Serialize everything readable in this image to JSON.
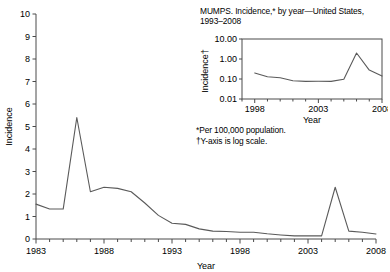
{
  "chart_data": [
    {
      "id": "main",
      "type": "line",
      "title": "",
      "xlabel": "Year",
      "ylabel": "Incidence",
      "xlim": [
        1983,
        2008
      ],
      "ylim": [
        0,
        10
      ],
      "yticks": [
        0,
        1,
        2,
        3,
        4,
        5,
        6,
        7,
        8,
        9,
        10
      ],
      "ytick_labels": [
        "0",
        "1",
        "2",
        "3",
        "4",
        "5",
        "6",
        "7",
        "8",
        "9",
        "10"
      ],
      "xticks": [
        1983,
        1984,
        1985,
        1986,
        1987,
        1988,
        1989,
        1990,
        1991,
        1992,
        1993,
        1994,
        1995,
        1996,
        1997,
        1998,
        1999,
        2000,
        2001,
        2002,
        2003,
        2004,
        2005,
        2006,
        2007,
        2008
      ],
      "xtick_labels": [
        "1983",
        "1988",
        "1993",
        "1998",
        "2003",
        "2008"
      ],
      "xtick_labeled_values": [
        1983,
        1988,
        1993,
        1998,
        2003,
        2008
      ],
      "grid": false,
      "legend": "none",
      "x": [
        1983,
        1984,
        1985,
        1986,
        1987,
        1988,
        1989,
        1990,
        1991,
        1992,
        1993,
        1994,
        1995,
        1996,
        1997,
        1998,
        1999,
        2000,
        2001,
        2002,
        2003,
        2004,
        2005,
        2006,
        2007,
        2008
      ],
      "values": [
        1.55,
        1.33,
        1.33,
        5.4,
        2.1,
        2.3,
        2.25,
        2.1,
        1.6,
        1.05,
        0.7,
        0.65,
        0.45,
        0.35,
        0.33,
        0.3,
        0.3,
        0.23,
        0.18,
        0.14,
        0.14,
        0.14,
        2.3,
        0.35,
        0.3,
        0.22
      ]
    },
    {
      "id": "inset",
      "type": "line",
      "title": "MUMPS. Incidence,* by year—United States, 1993–2008",
      "xlabel": "Year",
      "ylabel": "Incidence",
      "ylabel_marker": "†",
      "xlim": [
        1997,
        2008
      ],
      "ylim": [
        0.01,
        10.0
      ],
      "yscale": "log",
      "yticks": [
        0.01,
        0.1,
        1.0,
        10.0
      ],
      "ytick_labels": [
        "0.01",
        "0.10",
        "1.00",
        "10.00"
      ],
      "xticks": [
        1997,
        1998,
        1999,
        2000,
        2001,
        2002,
        2003,
        2004,
        2005,
        2006,
        2007,
        2008
      ],
      "xtick_labels": [
        "1998",
        "2003",
        "2008"
      ],
      "xtick_labeled_values": [
        1998,
        2003,
        2008
      ],
      "grid": false,
      "legend": "none",
      "x": [
        1998,
        1999,
        2000,
        2001,
        2002,
        2003,
        2004,
        2005,
        2006,
        2007,
        2008
      ],
      "values": [
        0.2,
        0.13,
        0.115,
        0.082,
        0.076,
        0.077,
        0.076,
        0.098,
        2.0,
        0.28,
        0.14
      ]
    }
  ],
  "inset": {
    "title_line1": "MUMPS. Incidence,* by year—United States,",
    "title_line2": "1993–2008",
    "ylabel": "Incidence",
    "ylabel_dagger": "†",
    "xlabel": "Year",
    "ytick_labels": [
      "10.00",
      "1.00",
      "0.10",
      "0.01"
    ],
    "xtick_labels": [
      "1998",
      "2003",
      "2008"
    ]
  },
  "footnotes": {
    "line1": "*Per 100,000 population.",
    "line2": "†Y-axis is log scale."
  },
  "main": {
    "ylabel": "Incidence",
    "xlabel": "Year",
    "ytick_labels": [
      "10",
      "9",
      "8",
      "7",
      "6",
      "5",
      "4",
      "3",
      "2",
      "1",
      "0"
    ],
    "xtick_labels": [
      "1983",
      "1988",
      "1993",
      "1998",
      "2003",
      "2008"
    ]
  },
  "colors": {
    "line": "#5a5a5a",
    "axis": "#4a4a4a",
    "text": "#000000",
    "background": "#ffffff"
  }
}
